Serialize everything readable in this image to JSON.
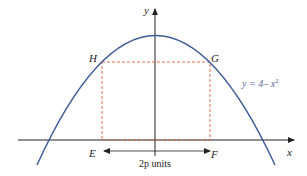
{
  "figure": {
    "equation": "y = 4– x",
    "equation_exponent": "2",
    "axis_labels": {
      "x": "x",
      "y": "y"
    },
    "points": {
      "H": "H",
      "G": "G",
      "E": "E",
      "F": "F"
    },
    "width_label_var": "2p",
    "width_label_unit": " units",
    "colors": {
      "curve": "#3d5a99",
      "rectangle": "#e0603a",
      "axes": "#222222"
    }
  }
}
